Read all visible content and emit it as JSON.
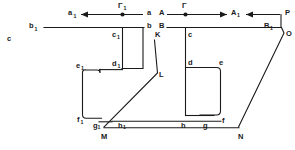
{
  "diagram": {
    "background_color": "#ffffff",
    "line_color": "#1a1a1a",
    "labels": {
      "c_free": "c",
      "b1": "b",
      "b1_sub": "1",
      "a1": "a",
      "a1_sub": "1",
      "gamma1": "Γ",
      "gamma1_sub": "1",
      "a": "a",
      "b": "b",
      "c1": "c",
      "c1_sub": "1",
      "d1": "d",
      "d1_sub": "1",
      "e1": "e",
      "e1_sub": "1",
      "f1": "f",
      "f1_sub": "1",
      "g1": "g",
      "g1_sub": "1",
      "h1": "h",
      "h1_sub": "1",
      "K": "K",
      "L": "L",
      "M": "M",
      "N": "N",
      "A": "A",
      "gamma": "Γ",
      "A1": "A",
      "A1_sub": "1",
      "B": "B",
      "c": "c",
      "B1": "B",
      "B1_sub": "1",
      "P": "P",
      "O": "O",
      "d": "d",
      "e": "e",
      "f": "f",
      "g": "g",
      "h": "h"
    },
    "arrows": [
      {
        "name": "arrow-to-a1",
        "direction": "left"
      },
      {
        "name": "arrow-to-A1",
        "direction": "right"
      },
      {
        "name": "arrow-from-P",
        "direction": "left"
      }
    ],
    "points": [
      {
        "name": "gamma1-point",
        "label": "Γ₁"
      },
      {
        "name": "gamma-point",
        "label": "Γ"
      }
    ]
  }
}
